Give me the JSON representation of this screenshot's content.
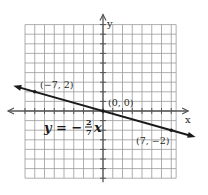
{
  "chart_data": {
    "type": "line",
    "title": "",
    "xlabel": "x",
    "ylabel": "y",
    "xlim": [
      -8,
      7.5
    ],
    "ylim": [
      -7,
      9
    ],
    "grid": true,
    "equation": {
      "lhs": "y = −",
      "num": "2",
      "den": "7",
      "var": "x"
    },
    "series": [
      {
        "name": "y = -2/7 x",
        "slope": -0.2857,
        "intercept": 0,
        "points": [
          {
            "x": -7,
            "y": 2
          },
          {
            "x": 0,
            "y": 0
          },
          {
            "x": 7,
            "y": -2
          }
        ]
      }
    ],
    "annotations": [
      {
        "text": "(−7, 2)",
        "x": -7,
        "y": 2
      },
      {
        "text": "(0, 0)",
        "x": 0,
        "y": 0
      },
      {
        "text": "(7, −2)",
        "x": 7,
        "y": -2
      }
    ],
    "colors": {
      "grid": "#9a9a9a",
      "axis": "#555555",
      "line": "#1a1a1a"
    }
  }
}
